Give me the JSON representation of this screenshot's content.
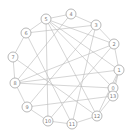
{
  "figure": {
    "kind": "node-link-graph",
    "width": 134,
    "height": 133,
    "background_color": "#ffffff"
  },
  "chart_data": {
    "type": "diagram",
    "title": "",
    "subtitle": "",
    "xlabel": "",
    "ylabel": "",
    "layout": "circular",
    "grid": false,
    "legend": "none",
    "node_style": {
      "shape": "circle",
      "radius": 5,
      "fill_color": "#ffffff",
      "stroke_color": "#9a9a9a",
      "label_color": "#7a7a7a"
    },
    "edge_style": {
      "color": "#b9b9b9",
      "width": 0.6,
      "directed": false
    },
    "node_count": 14,
    "edge_count": 28,
    "nodes": [
      {
        "id": "0",
        "label": "0",
        "x": 113,
        "y": 88
      },
      {
        "id": "1",
        "label": "1",
        "x": 119,
        "y": 70
      },
      {
        "id": "2",
        "label": "2",
        "x": 114,
        "y": 44
      },
      {
        "id": "3",
        "label": "3",
        "x": 96,
        "y": 25
      },
      {
        "id": "4",
        "label": "4",
        "x": 71,
        "y": 14
      },
      {
        "id": "5",
        "label": "5",
        "x": 46,
        "y": 19
      },
      {
        "id": "6",
        "label": "6",
        "x": 26,
        "y": 33
      },
      {
        "id": "7",
        "label": "7",
        "x": 13,
        "y": 57
      },
      {
        "id": "8",
        "label": "8",
        "x": 15,
        "y": 83
      },
      {
        "id": "9",
        "label": "9",
        "x": 27,
        "y": 107
      },
      {
        "id": "10",
        "label": "10",
        "x": 48,
        "y": 121
      },
      {
        "id": "11",
        "label": "11",
        "x": 72,
        "y": 124
      },
      {
        "id": "12",
        "label": "12",
        "x": 97,
        "y": 116
      },
      {
        "id": "13",
        "label": "13",
        "x": 113,
        "y": 96
      }
    ],
    "edges": [
      {
        "source": "0",
        "target": "1"
      },
      {
        "source": "0",
        "target": "13"
      },
      {
        "source": "0",
        "target": "8"
      },
      {
        "source": "0",
        "target": "5"
      },
      {
        "source": "1",
        "target": "2"
      },
      {
        "source": "1",
        "target": "13"
      },
      {
        "source": "1",
        "target": "5"
      },
      {
        "source": "1",
        "target": "8"
      },
      {
        "source": "2",
        "target": "3"
      },
      {
        "source": "2",
        "target": "5"
      },
      {
        "source": "2",
        "target": "10"
      },
      {
        "source": "2",
        "target": "8"
      },
      {
        "source": "3",
        "target": "4"
      },
      {
        "source": "3",
        "target": "6"
      },
      {
        "source": "3",
        "target": "9"
      },
      {
        "source": "3",
        "target": "11"
      },
      {
        "source": "4",
        "target": "5"
      },
      {
        "source": "4",
        "target": "8"
      },
      {
        "source": "5",
        "target": "6"
      },
      {
        "source": "5",
        "target": "10"
      },
      {
        "source": "5",
        "target": "12"
      },
      {
        "source": "6",
        "target": "7"
      },
      {
        "source": "6",
        "target": "11"
      },
      {
        "source": "7",
        "target": "8"
      },
      {
        "source": "7",
        "target": "12"
      },
      {
        "source": "8",
        "target": "9"
      },
      {
        "source": "9",
        "target": "10"
      },
      {
        "source": "9",
        "target": "13"
      },
      {
        "source": "10",
        "target": "11"
      },
      {
        "source": "11",
        "target": "12"
      },
      {
        "source": "12",
        "target": "13"
      },
      {
        "source": "12",
        "target": "1"
      }
    ]
  }
}
